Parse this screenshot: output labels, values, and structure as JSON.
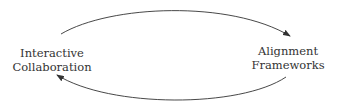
{
  "diagram": {
    "type": "cycle",
    "nodes": [
      {
        "id": "interactive-collaboration",
        "lines": [
          "Interactive",
          "Collaboration"
        ]
      },
      {
        "id": "alignment-frameworks",
        "lines": [
          "Alignment",
          "Frameworks"
        ]
      }
    ],
    "edges": [
      {
        "from": "interactive-collaboration",
        "to": "alignment-frameworks",
        "position": "top"
      },
      {
        "from": "alignment-frameworks",
        "to": "interactive-collaboration",
        "position": "bottom"
      }
    ],
    "colors": {
      "stroke": "#333333",
      "text": "#333333",
      "background": "#ffffff"
    }
  }
}
